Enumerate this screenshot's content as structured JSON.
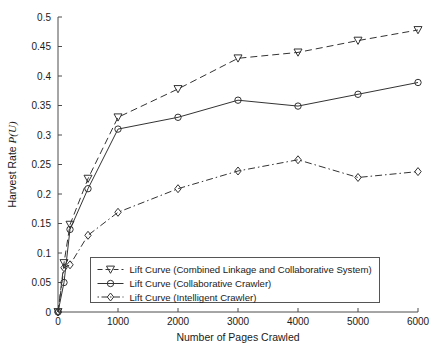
{
  "chart_data": {
    "type": "line",
    "title": "",
    "subtitle": "",
    "xlabel": "Number of Pages Crawled",
    "ylabel": "Harvest Rate P(U)",
    "ylabel_plain": "Harvest Rate ",
    "ylabel_italic": "P(U)",
    "xlim": [
      0,
      6000
    ],
    "ylim": [
      0,
      0.5
    ],
    "grid": false,
    "legend_position": "lower center",
    "xticks": [
      0,
      1000,
      2000,
      3000,
      4000,
      5000,
      6000
    ],
    "xtick_labels": [
      "0",
      "1000",
      "2000",
      "3000",
      "4000",
      "5000",
      "6000"
    ],
    "yticks": [
      0,
      0.05,
      0.1,
      0.15,
      0.2,
      0.25,
      0.3,
      0.35,
      0.4,
      0.45,
      0.5
    ],
    "ytick_labels": [
      "0",
      "0.05",
      "0.1",
      "0.15",
      "0.2",
      "0.25",
      "0.3",
      "0.35",
      "0.4",
      "0.45",
      "0.5"
    ],
    "series": [
      {
        "name": "Lift Curve (Combined Linkage and Collaborative System)",
        "marker": "triangle-down",
        "linestyle": "dashed",
        "color": "#333333",
        "x": [
          0,
          100,
          200,
          500,
          1000,
          2000,
          3000,
          4000,
          5000,
          6000
        ],
        "values": [
          0.0,
          0.083,
          0.148,
          0.226,
          0.33,
          0.378,
          0.43,
          0.44,
          0.46,
          0.478
        ]
      },
      {
        "name": "Lift Curve (Collaborative Crawler)",
        "marker": "circle",
        "linestyle": "solid",
        "color": "#333333",
        "x": [
          0,
          100,
          200,
          500,
          1000,
          2000,
          3000,
          4000,
          5000,
          6000
        ],
        "values": [
          0.0,
          0.05,
          0.14,
          0.209,
          0.31,
          0.33,
          0.359,
          0.349,
          0.369,
          0.389
        ]
      },
      {
        "name": "Lift Curve (Intelligent Crawler)",
        "marker": "diamond",
        "linestyle": "dashdot",
        "color": "#333333",
        "x": [
          0,
          100,
          200,
          500,
          1000,
          2000,
          3000,
          4000,
          5000,
          6000
        ],
        "values": [
          0.0,
          0.075,
          0.08,
          0.13,
          0.169,
          0.209,
          0.239,
          0.258,
          0.228,
          0.238
        ]
      }
    ]
  },
  "legend": {
    "entries": [
      "Lift Curve (Combined Linkage and Collaborative System)",
      "Lift Curve (Collaborative Crawler)",
      "Lift Curve (Intelligent Crawler)"
    ]
  },
  "colors": {
    "axis": "#4d4d4d",
    "series": "#333333",
    "background": "#ffffff",
    "text": "#1a1a1a"
  }
}
